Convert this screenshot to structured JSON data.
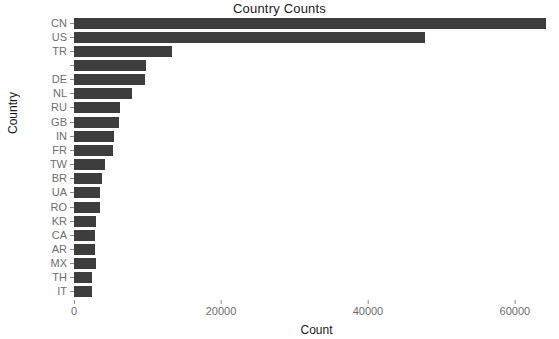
{
  "chart_data": {
    "type": "bar",
    "orientation": "horizontal",
    "title": "Country Counts",
    "xlabel": "Count",
    "ylabel": "Country",
    "categories": [
      "CN",
      "US",
      "TR",
      "",
      "DE",
      "NL",
      "RU",
      "GB",
      "IN",
      "FR",
      "TW",
      "BR",
      "UA",
      "RO",
      "KR",
      "CA",
      "AR",
      "MX",
      "TH",
      "IT"
    ],
    "values": [
      64200,
      47800,
      13400,
      9750,
      9700,
      7850,
      6200,
      6100,
      5400,
      5300,
      4200,
      3800,
      3500,
      3500,
      3000,
      2900,
      2900,
      3000,
      2500,
      2400
    ],
    "xlim": [
      0,
      66000
    ],
    "xticks": [
      0,
      20000,
      40000,
      60000
    ],
    "xtick_labels": [
      "0",
      "20000",
      "40000",
      "60000"
    ],
    "grid": false,
    "legend": null,
    "bar_color": "#3d3d3d",
    "background": "#ffffff",
    "tick_label_color": "#6e6e6e",
    "title_color": "#1a1a1a"
  }
}
